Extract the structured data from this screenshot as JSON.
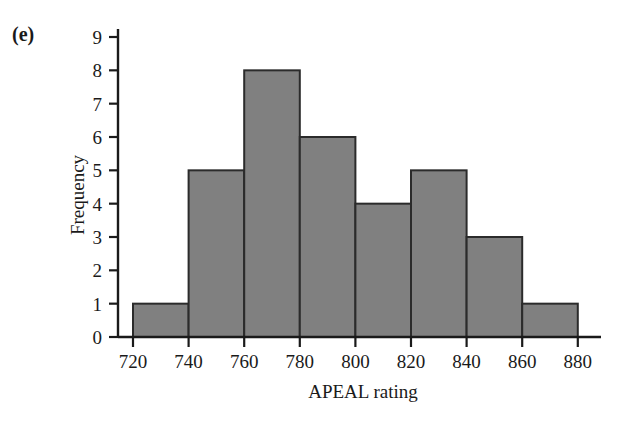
{
  "figure": {
    "panel_label": "(e)",
    "background_color": "#ffffff"
  },
  "chart_data": {
    "type": "bar",
    "title": "",
    "subtitle": "",
    "xlabel": "APEAL rating",
    "ylabel": "Frequency",
    "categories": [
      "720-740",
      "740-760",
      "760-780",
      "780-800",
      "800-820",
      "820-840",
      "840-860",
      "860-880"
    ],
    "bin_edges": [
      720,
      740,
      760,
      780,
      800,
      820,
      840,
      860,
      880
    ],
    "bin_width": 20,
    "values": [
      1,
      5,
      8,
      6,
      4,
      5,
      3,
      1
    ],
    "total_count": 33,
    "xlim": [
      712,
      892
    ],
    "ylim": [
      0,
      9
    ],
    "xticks": [
      720,
      740,
      760,
      780,
      800,
      820,
      840,
      860,
      880
    ],
    "xtick_labels": [
      "720",
      "740",
      "760",
      "780",
      "800",
      "820",
      "840",
      "860",
      "880"
    ],
    "yticks": [
      0,
      1,
      2,
      3,
      4,
      5,
      6,
      7,
      8,
      9
    ],
    "ytick_labels": [
      "0",
      "1",
      "2",
      "3",
      "4",
      "5",
      "6",
      "7",
      "8",
      "9"
    ],
    "grid": false,
    "legend": false,
    "legend_position": "none",
    "bar_fill_color": "#808080",
    "bar_edge_color": "#2b2b2b",
    "axis_color": "#1a1a1a"
  }
}
